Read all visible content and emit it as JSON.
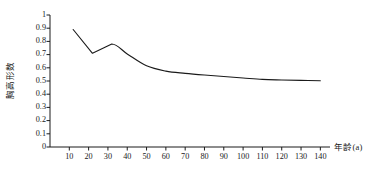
{
  "chart_data": {
    "type": "line",
    "title": "",
    "subtitle": "",
    "xlabel": "年龄(a)",
    "ylabel": "胸高形数",
    "xlim": [
      0,
      145
    ],
    "ylim": [
      0,
      1
    ],
    "grid": false,
    "legend": null,
    "legend_position": "none",
    "line_color": "#1a1a1a",
    "axis_color": "#1a1a1a",
    "x_ticks": [
      10,
      20,
      30,
      40,
      50,
      60,
      70,
      80,
      90,
      100,
      110,
      120,
      130,
      140
    ],
    "x_tick_labels": [
      "10",
      "20",
      "30",
      "40",
      "50",
      "60",
      "70",
      "80",
      "90",
      "100",
      "110",
      "120",
      "130",
      "140"
    ],
    "y_ticks": [
      0,
      0.1,
      0.2,
      0.3,
      0.4,
      0.5,
      0.6,
      0.7,
      0.8,
      0.9,
      1
    ],
    "y_tick_labels": [
      "0",
      "0.1",
      "0.2",
      "0.3",
      "0.4",
      "0.5",
      "0.6",
      "0.7",
      "0.8",
      "0.9",
      "1"
    ],
    "series": [
      {
        "name": "胸高形数",
        "x": [
          12,
          22,
          32,
          40,
          50,
          60,
          70,
          80,
          90,
          100,
          110,
          120,
          130,
          140
        ],
        "values": [
          0.89,
          0.71,
          0.78,
          0.705,
          0.615,
          0.575,
          0.558,
          0.545,
          0.534,
          0.523,
          0.512,
          0.508,
          0.505,
          0.502
        ]
      }
    ]
  }
}
